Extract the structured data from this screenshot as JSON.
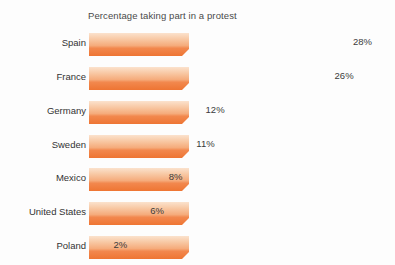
{
  "chart_data": {
    "type": "bar",
    "orientation": "horizontal",
    "title": "Percentage taking part in a protest",
    "xlabel": "",
    "ylabel": "",
    "categories": [
      "Spain",
      "France",
      "Germany",
      "Sweden",
      "Mexico",
      "United States",
      "Poland"
    ],
    "values": [
      28,
      26,
      12,
      11,
      8,
      6,
      2
    ],
    "value_labels": [
      "28%",
      "26%",
      "12%",
      "11%",
      "8%",
      "6%",
      "2%"
    ],
    "xlim": [
      0,
      28
    ],
    "grid": false,
    "legend": null,
    "axis_visible": false,
    "bar_style": "beveled-3d",
    "colors": {
      "bar_top": "#f9d9c0",
      "bar_mid": "#f6b186",
      "bar_band": "#f2854a",
      "bar_bottom": "#ef7b39",
      "bar_bevel": "#f29355",
      "background": "#fdfdfd",
      "title_text": "#4a4a4a",
      "category_text": "#333333",
      "value_text": "#3b3b3b"
    }
  }
}
